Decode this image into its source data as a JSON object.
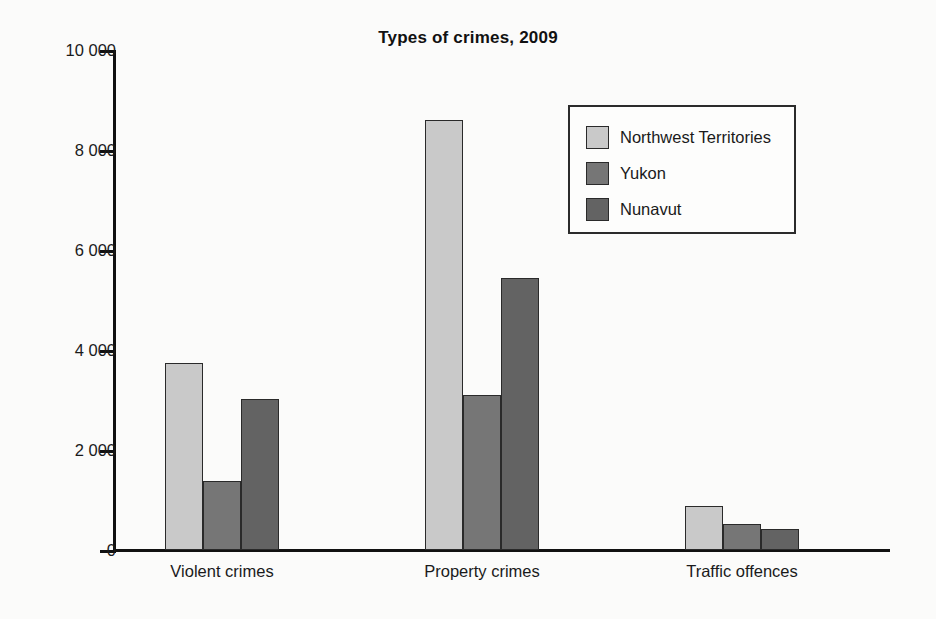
{
  "chart_data": {
    "type": "bar",
    "title": "Types of crimes, 2009",
    "xlabel": "",
    "ylabel": "",
    "ylim": [
      0,
      10000
    ],
    "ytick_labels": [
      "0",
      "2 000",
      "4 000",
      "6 000",
      "8 000",
      "10 000"
    ],
    "ytick_values": [
      0,
      2000,
      4000,
      6000,
      8000,
      10000
    ],
    "grid": false,
    "legend_position": "upper right",
    "categories": [
      "Violent crimes",
      "Property crimes",
      "Traffic offences"
    ],
    "series": [
      {
        "name": "Northwest Territories",
        "color": "#c9c9c9",
        "values": [
          3750,
          8600,
          890
        ]
      },
      {
        "name": "Yukon",
        "color": "#767676",
        "values": [
          1390,
          3100,
          520
        ]
      },
      {
        "name": "Nunavut",
        "color": "#636363",
        "values": [
          3030,
          5440,
          420
        ]
      }
    ]
  },
  "colors": {
    "axis": "#111111",
    "text": "#1a1a1a",
    "background": "#fbfbfa",
    "bar_outline": "#2a2a2a",
    "legend_border": "#2b2b2b"
  }
}
